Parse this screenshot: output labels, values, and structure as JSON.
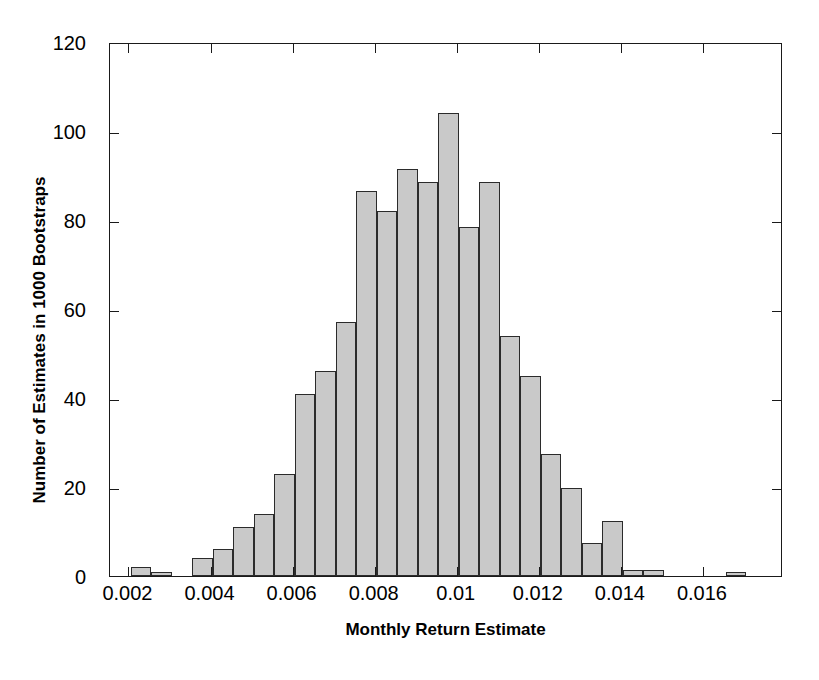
{
  "chart_data": {
    "type": "bar",
    "title": "",
    "xlabel": "Monthly Return Estimate",
    "ylabel": "Number of Estimates in 1000 Bootstraps",
    "xlim": [
      0.00155,
      0.01795
    ],
    "ylim": [
      0,
      120
    ],
    "xticks": [
      0.002,
      0.004,
      0.006,
      0.008,
      0.01,
      0.012,
      0.014,
      0.016
    ],
    "xtick_labels": [
      "0.002",
      "0.004",
      "0.006",
      "0.008",
      "0.01",
      "0.012",
      "0.014",
      "0.016"
    ],
    "yticks": [
      0,
      20,
      40,
      60,
      80,
      100,
      120
    ],
    "ytick_labels": [
      "0",
      "20",
      "40",
      "60",
      "80",
      "100",
      "120"
    ],
    "grid": false,
    "legend": null,
    "bin_width": 0.0005,
    "bar_color": "#c9c9c9",
    "bar_edge_color": "#2b2b2b",
    "axis_color": "#1a1a1a",
    "bins": [
      {
        "left": 0.00205,
        "right": 0.00255,
        "value": 2
      },
      {
        "left": 0.00255,
        "right": 0.00305,
        "value": 1
      },
      {
        "left": 0.00305,
        "right": 0.00355,
        "value": 0
      },
      {
        "left": 0.00355,
        "right": 0.00405,
        "value": 4
      },
      {
        "left": 0.00405,
        "right": 0.00455,
        "value": 6
      },
      {
        "left": 0.00455,
        "right": 0.00505,
        "value": 11
      },
      {
        "left": 0.00505,
        "right": 0.00555,
        "value": 14
      },
      {
        "left": 0.00555,
        "right": 0.00605,
        "value": 23
      },
      {
        "left": 0.00605,
        "right": 0.00655,
        "value": 41
      },
      {
        "left": 0.00655,
        "right": 0.00705,
        "value": 46
      },
      {
        "left": 0.00705,
        "right": 0.00755,
        "value": 57
      },
      {
        "left": 0.00755,
        "right": 0.00805,
        "value": 86.5
      },
      {
        "left": 0.00805,
        "right": 0.00855,
        "value": 82
      },
      {
        "left": 0.00855,
        "right": 0.00905,
        "value": 91.5
      },
      {
        "left": 0.00905,
        "right": 0.00955,
        "value": 88.5
      },
      {
        "left": 0.00955,
        "right": 0.01005,
        "value": 104
      },
      {
        "left": 0.01005,
        "right": 0.01055,
        "value": 78.5
      },
      {
        "left": 0.01055,
        "right": 0.01105,
        "value": 88.5
      },
      {
        "left": 0.01105,
        "right": 0.01155,
        "value": 54
      },
      {
        "left": 0.01155,
        "right": 0.01205,
        "value": 45
      },
      {
        "left": 0.01205,
        "right": 0.01255,
        "value": 27.5
      },
      {
        "left": 0.01255,
        "right": 0.01305,
        "value": 19.8
      },
      {
        "left": 0.01305,
        "right": 0.01355,
        "value": 7.5
      },
      {
        "left": 0.01355,
        "right": 0.01405,
        "value": 12.3
      },
      {
        "left": 0.01405,
        "right": 0.01455,
        "value": 1.3
      },
      {
        "left": 0.01455,
        "right": 0.01505,
        "value": 1.3
      },
      {
        "left": 0.01655,
        "right": 0.01705,
        "value": 0.9
      }
    ]
  }
}
